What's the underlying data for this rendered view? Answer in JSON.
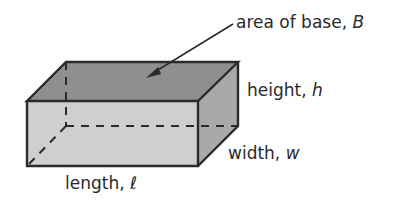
{
  "figure": {
    "shape": "rectangular prism",
    "colors": {
      "top_face": "#8f8f8f",
      "front_face": "#cfcfcf",
      "right_face": "#a9a9a9",
      "edge": "#2b2b2b",
      "text": "#2a2a2a"
    }
  },
  "labels": {
    "base": {
      "text": "area of base, ",
      "var": "B"
    },
    "height": {
      "text": "height, ",
      "var": "h"
    },
    "width": {
      "text": "width, ",
      "var": "w"
    },
    "length": {
      "text": "length, ",
      "var": "ℓ"
    }
  }
}
